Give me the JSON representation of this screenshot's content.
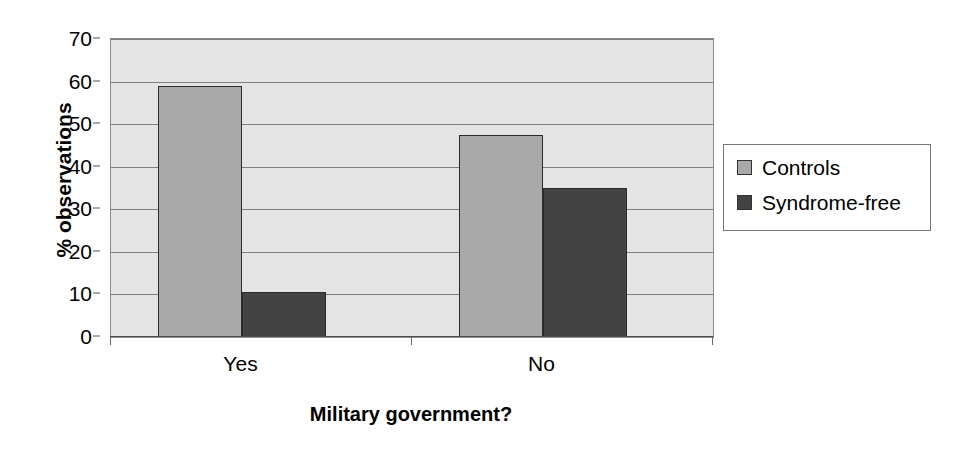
{
  "chart_data": {
    "type": "bar",
    "title": "",
    "xlabel": "Military government?",
    "ylabel": "% observations",
    "categories": [
      "Yes",
      "No"
    ],
    "series": [
      {
        "name": "Controls",
        "color": "#a9a9a9",
        "values": [
          59,
          47.5
        ]
      },
      {
        "name": "Syndrome-free",
        "color": "#434343",
        "values": [
          10.5,
          35
        ]
      }
    ],
    "ylim": [
      0,
      70
    ],
    "ytick_values": [
      0,
      10,
      20,
      30,
      40,
      50,
      60,
      70
    ],
    "ytick_labels": [
      "0",
      "10",
      "20",
      "30",
      "40",
      "50",
      "60",
      "70"
    ],
    "grid": "horizontal",
    "legend_position": "right",
    "plot_background": "#e4e4e4",
    "gridline_color": "#7e7e7e",
    "axis_color": "#4d4d4d"
  },
  "axes": {
    "y_title": "% observations",
    "x_title": "Military government?"
  },
  "legend": {
    "entries": [
      {
        "label": "Controls"
      },
      {
        "label": "Syndrome-free"
      }
    ]
  },
  "x_categories": [
    {
      "label": "Yes"
    },
    {
      "label": "No"
    }
  ],
  "y_ticks": [
    {
      "label": "70"
    },
    {
      "label": "60"
    },
    {
      "label": "50"
    },
    {
      "label": "40"
    },
    {
      "label": "30"
    },
    {
      "label": "20"
    },
    {
      "label": "10"
    },
    {
      "label": "0"
    }
  ]
}
